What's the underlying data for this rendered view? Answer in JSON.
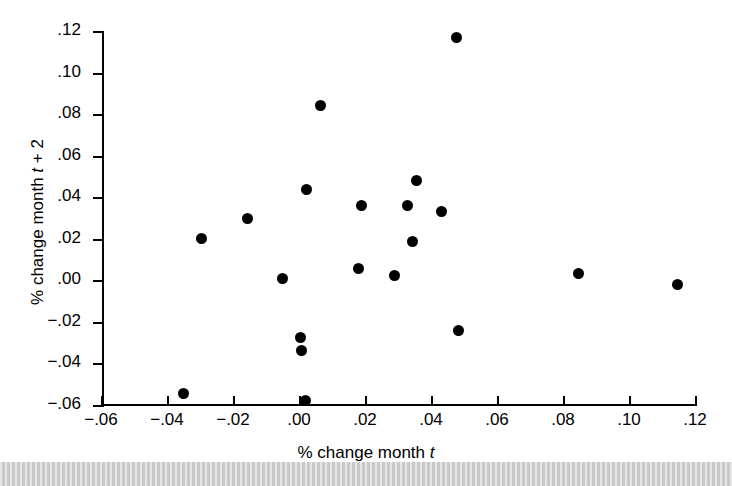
{
  "figure": {
    "background": "#ffffff",
    "point_color": "#000000",
    "axis_color": "#000000"
  },
  "axes": {
    "x_title_prefix": "% change month ",
    "x_title_var": "t",
    "x_title_suffix": "",
    "y_title_prefix": "% change month ",
    "y_title_var": "t",
    "y_title_suffix": " + 2",
    "x_ticklabels": [
      "−.06",
      "−.04",
      "−.02",
      ".00",
      ".02",
      ".04",
      ".06",
      ".08",
      ".10",
      ".12"
    ],
    "y_ticklabels": [
      ".12",
      ".10",
      ".08",
      ".06",
      ".04",
      ".02",
      ".00",
      "−.02",
      "−.04",
      "−.06"
    ]
  },
  "chart_data": {
    "type": "scatter",
    "title": "",
    "xlabel": "% change month t",
    "ylabel": "% change month t + 2",
    "xlim": [
      -0.06,
      0.12
    ],
    "ylim": [
      -0.06,
      0.12
    ],
    "xticks": [
      -0.06,
      -0.04,
      -0.02,
      0.0,
      0.02,
      0.04,
      0.06,
      0.08,
      0.1,
      0.12
    ],
    "yticks": [
      -0.06,
      -0.04,
      -0.02,
      0.0,
      0.02,
      0.04,
      0.06,
      0.08,
      0.1,
      0.12
    ],
    "grid": false,
    "legend": null,
    "marker": "filled-circle",
    "n_points": 20,
    "x": [
      -0.0352,
      -0.0297,
      -0.0158,
      -0.0052,
      0.0003,
      0.0006,
      0.0018,
      0.0021,
      0.0061,
      0.0176,
      0.0185,
      0.0285,
      0.0327,
      0.0342,
      0.0354,
      0.043,
      0.0473,
      0.0479,
      0.0843,
      0.1145
    ],
    "y": [
      -0.054,
      0.0205,
      0.0303,
      0.0012,
      -0.027,
      -0.0333,
      -0.0572,
      0.0443,
      0.0846,
      0.0063,
      0.0366,
      0.003,
      0.0366,
      0.019,
      0.0487,
      0.0337,
      0.1172,
      -0.0238,
      0.0036,
      -0.0017
    ],
    "points": [
      {
        "x": -0.0352,
        "y": -0.054
      },
      {
        "x": -0.0297,
        "y": 0.0205
      },
      {
        "x": -0.0158,
        "y": 0.0303
      },
      {
        "x": -0.0052,
        "y": 0.0012
      },
      {
        "x": 0.0003,
        "y": -0.027
      },
      {
        "x": 0.0006,
        "y": -0.0333
      },
      {
        "x": 0.0018,
        "y": -0.0572
      },
      {
        "x": 0.0021,
        "y": 0.0443
      },
      {
        "x": 0.0061,
        "y": 0.0846
      },
      {
        "x": 0.0176,
        "y": 0.0063
      },
      {
        "x": 0.0185,
        "y": 0.0366
      },
      {
        "x": 0.0285,
        "y": 0.003
      },
      {
        "x": 0.0327,
        "y": 0.0366
      },
      {
        "x": 0.0342,
        "y": 0.019
      },
      {
        "x": 0.0354,
        "y": 0.0487
      },
      {
        "x": 0.043,
        "y": 0.0337
      },
      {
        "x": 0.0473,
        "y": 0.1172
      },
      {
        "x": 0.0479,
        "y": -0.0238
      },
      {
        "x": 0.0843,
        "y": 0.0036
      },
      {
        "x": 0.1145,
        "y": -0.0017
      }
    ]
  }
}
